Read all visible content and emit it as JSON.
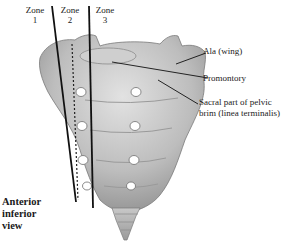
{
  "diagram": {
    "zones": [
      {
        "label": "Zone",
        "number": "1"
      },
      {
        "label": "Zone",
        "number": "2"
      },
      {
        "label": "Zone",
        "number": "3"
      }
    ],
    "callouts": [
      {
        "line1": "Ala (wing)",
        "line2": ""
      },
      {
        "line1": "Promontory",
        "line2": ""
      },
      {
        "line1": "Sacral part of pelvic",
        "line2": "brim (linea terminalis)"
      }
    ],
    "view_label": {
      "line1": "Anterior",
      "line2": "inferior",
      "line3": "view"
    },
    "colors": {
      "bone_light": "#d9d9d9",
      "bone_mid": "#b8b8b8",
      "bone_dark": "#8a8a8a",
      "lines": "#111111",
      "foramen": "#ffffff"
    }
  }
}
